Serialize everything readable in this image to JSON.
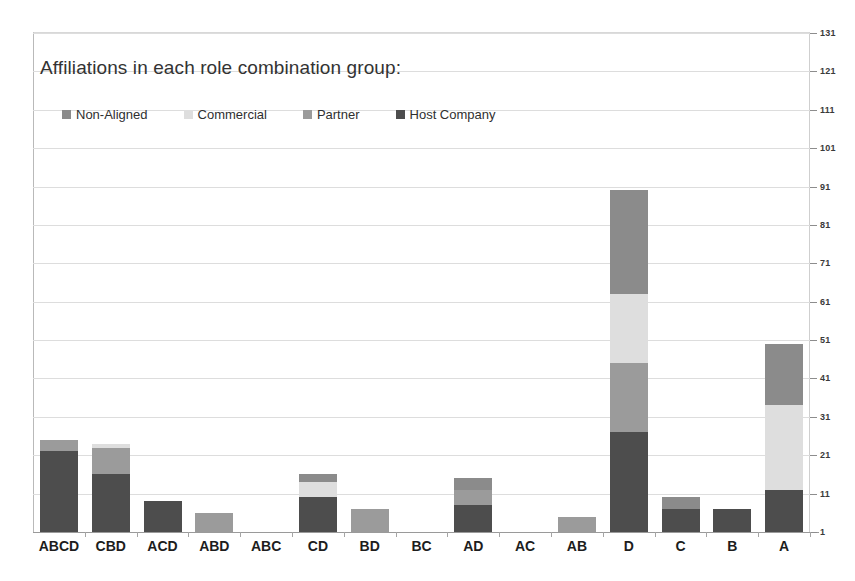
{
  "chart_data": {
    "type": "bar",
    "subtype": "stacked-vertical",
    "title": "Affiliations in each role combination group:",
    "xlabel": "",
    "ylabel": "",
    "ylim": [
      1,
      131
    ],
    "ytick_step": 10,
    "yticks": [
      1,
      11,
      21,
      31,
      41,
      51,
      61,
      71,
      81,
      91,
      101,
      111,
      121,
      131
    ],
    "ytick_labels": [
      "1",
      "11",
      "21",
      "31",
      "41",
      "51",
      "61",
      "71",
      "81",
      "91",
      "101",
      "111",
      "121",
      "131"
    ],
    "axis_position": "right",
    "grid": true,
    "legend_position": "top-left-inside",
    "categories": [
      "ABCD",
      "CBD",
      "ACD",
      "ABD",
      "ABC",
      "CD",
      "BD",
      "BC",
      "AD",
      "AC",
      "AB",
      "D",
      "C",
      "B",
      "A"
    ],
    "series": [
      {
        "name": "Host Company",
        "color": "#4d4d4d",
        "values": [
          21,
          15,
          8,
          0,
          0,
          9,
          0,
          0,
          7,
          0,
          0,
          26,
          6,
          6,
          11
        ]
      },
      {
        "name": "Partner",
        "color": "#9b9b9b",
        "values": [
          3,
          7,
          0,
          5,
          0,
          0,
          6,
          0,
          4,
          0,
          4,
          18,
          0,
          0,
          0
        ]
      },
      {
        "name": "Commercial",
        "color": "#dedede",
        "values": [
          0,
          1,
          0,
          0,
          0,
          4,
          0,
          0,
          0,
          0,
          0,
          18,
          0,
          0,
          22
        ]
      },
      {
        "name": "Non-Aligned",
        "color": "#8b8b8b",
        "values": [
          0,
          0,
          0,
          0,
          0,
          2,
          0,
          0,
          3,
          0,
          0,
          27,
          3,
          0,
          16
        ]
      }
    ],
    "totals": [
      24,
      23,
      8,
      5,
      0,
      15,
      6,
      0,
      14,
      0,
      4,
      89,
      9,
      6,
      49
    ]
  },
  "legend": {
    "items": [
      {
        "label": "Non-Aligned",
        "color": "#8b8b8b"
      },
      {
        "label": "Commercial",
        "color": "#dedede"
      },
      {
        "label": "Partner",
        "color": "#9b9b9b"
      },
      {
        "label": "Host Company",
        "color": "#4d4d4d"
      }
    ]
  },
  "colors": {
    "background": "#ffffff",
    "grid": "#dddddd",
    "axis": "#9a9a9a",
    "title_text": "#333333",
    "label_text": "#1d1d1d"
  }
}
